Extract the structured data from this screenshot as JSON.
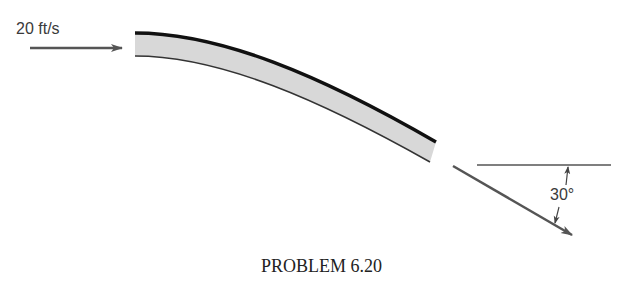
{
  "diagram": {
    "inlet": {
      "velocity_label": "20 ft/s",
      "direction": "horizontal-right"
    },
    "outlet": {
      "angle_label": "30°",
      "direction": "downward-right",
      "angle_below_horizontal_deg": 30
    },
    "vane": {
      "shape": "curved-deflecting-vane",
      "fill_color": "#d8d8d8",
      "edge_color": "#111111"
    },
    "caption": "PROBLEM 6.20",
    "colors": {
      "arrow": "#555555",
      "reference_line": "#555555",
      "text": "#3a3a3a"
    }
  }
}
